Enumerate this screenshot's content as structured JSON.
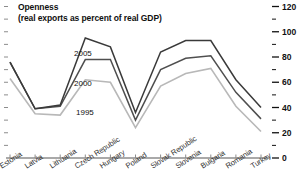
{
  "chart_data": {
    "type": "line",
    "title": "Openness",
    "subtitle": "(real exports as percent of real GDP)",
    "xlabel": "",
    "ylabel": "",
    "ylim": [
      0,
      120
    ],
    "yticks": [
      0,
      20,
      40,
      60,
      80,
      100,
      120
    ],
    "yticklabels": [
      "0",
      "20",
      "40",
      "60",
      "80",
      "100",
      "120"
    ],
    "minor_ticks": true,
    "axis_position": "right",
    "grid": false,
    "legend": "inline-annotations",
    "categories": [
      "Estonia",
      "Latvia",
      "Lithuania",
      "Czech Republic",
      "Hungary",
      "Poland",
      "Slovak Republic",
      "Slovenia",
      "Bulgaria",
      "Romania",
      "Turkey"
    ],
    "series": [
      {
        "name": "2005",
        "color": "#3a3a3a",
        "values": [
          76,
          39,
          42,
          95,
          88,
          36,
          84,
          93,
          93,
          62,
          40
        ]
      },
      {
        "name": "2000",
        "color": "#4f4f4f",
        "values": [
          76,
          39,
          41,
          78,
          78,
          30,
          70,
          79,
          81,
          52,
          31
        ]
      },
      {
        "name": "1995",
        "color": "#b8b8b8",
        "values": [
          63,
          35,
          34,
          62,
          60,
          24,
          57,
          67,
          71,
          41,
          21
        ]
      }
    ],
    "annotations": [
      {
        "text": "2005",
        "series": "2005"
      },
      {
        "text": "2000",
        "series": "2000"
      },
      {
        "text": "1995",
        "series": "1995"
      }
    ]
  },
  "colors": {
    "axis": "#8c8c8c",
    "text": "#111111",
    "series_2005": "#3a3a3a",
    "series_2000": "#4f4f4f",
    "series_1995": "#b8b8b8"
  }
}
